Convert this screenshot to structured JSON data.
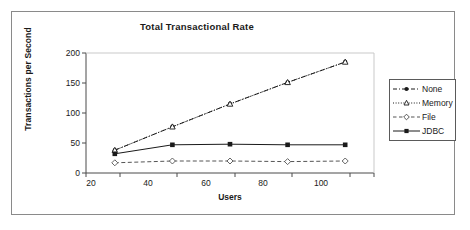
{
  "chart_data": {
    "type": "line",
    "title": "Total Transactional Rate",
    "xlabel": "Users",
    "ylabel": "Transactions per Second",
    "x": [
      20,
      40,
      60,
      80,
      100
    ],
    "xtick_labels": [
      "20",
      "40",
      "60",
      "80",
      "100"
    ],
    "ytick_labels": [
      "0",
      "50",
      "100",
      "150",
      "200"
    ],
    "yticks": [
      0,
      50,
      100,
      150,
      200
    ],
    "ylim": [
      0,
      200
    ],
    "xlim": [
      10,
      110
    ],
    "grid": false,
    "legend_position": "right-outside",
    "series": [
      {
        "name": "None",
        "values": [
          38,
          77,
          115,
          151,
          185
        ],
        "marker": "filled-circle",
        "dash": "dash-dot",
        "color": "#1a1a1a"
      },
      {
        "name": "Memory",
        "values": [
          38,
          77,
          115,
          151,
          185
        ],
        "marker": "open-triangle",
        "dash": "dotted",
        "color": "#1a1a1a"
      },
      {
        "name": "File",
        "values": [
          17,
          20,
          20,
          19,
          20
        ],
        "marker": "open-diamond",
        "dash": "dashed",
        "color": "#555555"
      },
      {
        "name": "JDBC",
        "values": [
          32,
          47,
          48,
          47,
          47
        ],
        "marker": "filled-square",
        "dash": "solid",
        "color": "#1a1a1a"
      }
    ]
  },
  "legend": {
    "items": [
      {
        "label": "None"
      },
      {
        "label": "Memory"
      },
      {
        "label": "File"
      },
      {
        "label": "JDBC"
      }
    ]
  }
}
